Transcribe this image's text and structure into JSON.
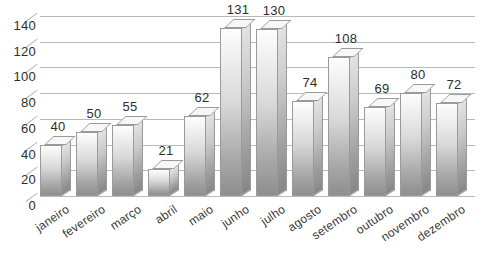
{
  "chart_data": {
    "type": "bar",
    "title": "",
    "subtitle": "",
    "xlabel": "",
    "ylabel": "",
    "categories": [
      "janeiro",
      "fevereiro",
      "março",
      "abril",
      "maio",
      "junho",
      "julho",
      "agosto",
      "setembro",
      "outubro",
      "novembro",
      "dezembro"
    ],
    "values": [
      40,
      50,
      55,
      21,
      62,
      131,
      130,
      74,
      108,
      69,
      80,
      72
    ],
    "data_labels": [
      "40",
      "50",
      "55",
      "21",
      "62",
      "131",
      "130",
      "74",
      "108",
      "69",
      "80",
      "72"
    ],
    "ylim": [
      0,
      140
    ],
    "ytick_step": 20,
    "yticks": [
      "0",
      "20",
      "40",
      "60",
      "80",
      "100",
      "120",
      "140"
    ],
    "grid": true,
    "legend": "none",
    "style": "3d-column",
    "colors": {
      "bar_top": "#fdfdfd",
      "bar_bottom": "#8e8e8e",
      "bar_side": "#c9c9c9",
      "bar_outline": "#9a9a9a",
      "gridline": "#b9b9b9",
      "text": "#2e2e2e",
      "background": "#ffffff"
    }
  }
}
